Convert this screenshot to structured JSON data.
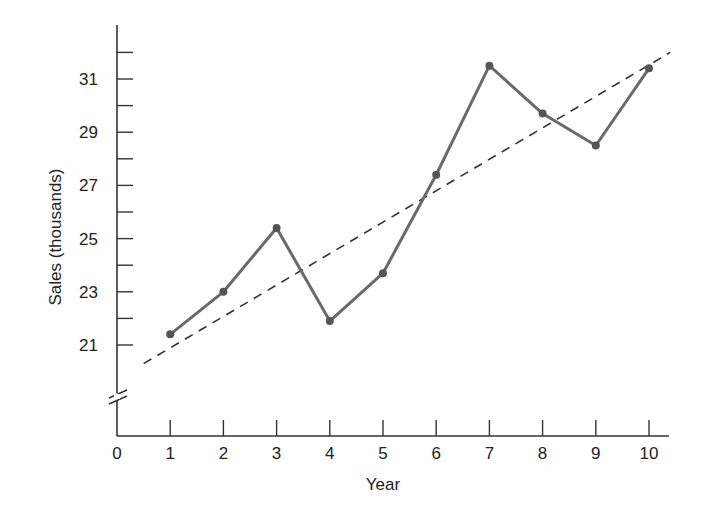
{
  "chart_data": {
    "type": "line",
    "title": "",
    "xlabel": "Year",
    "ylabel": "Sales (thousands)",
    "x": [
      1,
      2,
      3,
      4,
      5,
      6,
      7,
      8,
      9,
      10
    ],
    "x_ticks": [
      "0",
      "1",
      "2",
      "3",
      "4",
      "5",
      "6",
      "7",
      "8",
      "9",
      "10"
    ],
    "y_ticks": [
      "21",
      "23",
      "25",
      "27",
      "29",
      "31"
    ],
    "y_minor_ticks": [
      22,
      24,
      26,
      28,
      30,
      32
    ],
    "xlim": [
      0,
      10.4
    ],
    "ylim": [
      19,
      32.5
    ],
    "y_axis_break": true,
    "grid": false,
    "legend": null,
    "series": [
      {
        "name": "Sales",
        "style": "solid-with-markers",
        "values": [
          21.4,
          23.0,
          25.4,
          21.9,
          23.7,
          27.4,
          31.5,
          29.7,
          28.5,
          31.4
        ]
      },
      {
        "name": "Trend line",
        "style": "dashed",
        "x": [
          0.5,
          10.4
        ],
        "values": [
          20.3,
          32.0
        ]
      }
    ],
    "colors": {
      "series_line": "#6a6a6a",
      "marker": "#555555",
      "trend": "#333333",
      "axis": "#333333",
      "text": "#222222"
    }
  }
}
